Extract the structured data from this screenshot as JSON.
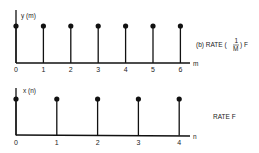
{
  "chart_data": [
    {
      "type": "stem",
      "title": "(b) RATE (1/M) F",
      "signal_label": "y (m)",
      "xlabel": "m",
      "categories": [
        "0",
        "1",
        "2",
        "3",
        "4",
        "5",
        "6"
      ],
      "values": [
        1,
        1,
        1,
        1,
        1,
        1,
        1
      ],
      "rate_prefix": "(b) RATE (",
      "rate_num": "1",
      "rate_den": "M",
      "rate_suffix": ") F"
    },
    {
      "type": "stem",
      "title": "RATE F",
      "signal_label": "x (n)",
      "xlabel": "n",
      "categories": [
        "0",
        "1",
        "2",
        "3",
        "4"
      ],
      "values": [
        1,
        1,
        1,
        1,
        1
      ]
    }
  ],
  "colors": {
    "ink": "#111111",
    "background": "#ffffff"
  }
}
